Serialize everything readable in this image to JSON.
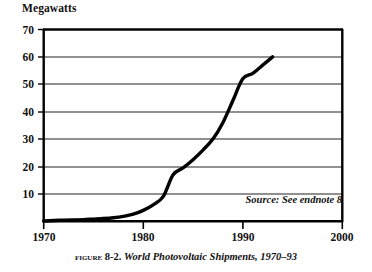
{
  "figure": {
    "caption_prefix": "Figure",
    "caption_number": "8-2.",
    "caption_title": "World Photovoltaic Shipments, 1970–93",
    "source_note": "Source: See endnote 8"
  },
  "chart_data": {
    "type": "line",
    "title": "World Photovoltaic Shipments, 1970–93",
    "xlabel": "",
    "ylabel": "Megawatts",
    "xlim": [
      1970,
      2000
    ],
    "ylim": [
      0,
      70
    ],
    "xticks": [
      1970,
      1980,
      1990,
      2000
    ],
    "xtick_labels": [
      "1970",
      "1980",
      "1990",
      "2000"
    ],
    "yticks": [
      10,
      20,
      30,
      40,
      50,
      60,
      70
    ],
    "ytick_labels": [
      "10",
      "20",
      "30",
      "40",
      "50",
      "60",
      "70"
    ],
    "grid": "horizontal",
    "legend": "none",
    "line_color": "#000000",
    "line_width": 3.4,
    "series": [
      {
        "name": "World photovoltaic shipments",
        "units": "megawatts",
        "x": [
          1970,
          1971,
          1972,
          1973,
          1974,
          1975,
          1976,
          1977,
          1978,
          1979,
          1980,
          1981,
          1982,
          1983,
          1984,
          1985,
          1986,
          1987,
          1988,
          1989,
          1990,
          1991,
          1992,
          1993
        ],
        "values": [
          0.1,
          0.3,
          0.4,
          0.5,
          0.6,
          0.8,
          1.0,
          1.3,
          1.8,
          2.6,
          4.0,
          6.0,
          9.0,
          17.0,
          19.5,
          22.5,
          26.0,
          30.0,
          36.0,
          44.0,
          52.0,
          54.0,
          57.0,
          60.0
        ]
      }
    ],
    "annotations": [
      {
        "text": "Source: See endnote 8",
        "x": 1993,
        "y": 3
      }
    ]
  }
}
